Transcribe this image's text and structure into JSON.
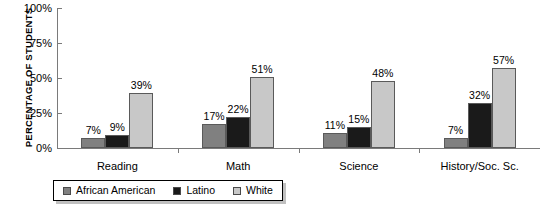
{
  "chart_data": {
    "type": "bar",
    "title": "",
    "xlabel": "",
    "ylabel": "PERCENTAGE OF STUDENTS",
    "ylim": [
      0,
      100
    ],
    "yticks": [
      "0%",
      "25%",
      "50%",
      "75%",
      "100%"
    ],
    "ytick_values": [
      0,
      25,
      50,
      75,
      100
    ],
    "grid": false,
    "legend_position": "bottom-left",
    "categories": [
      "Reading",
      "Math",
      "Science",
      "History/Soc. Sc."
    ],
    "series": [
      {
        "name": "African American",
        "color": "#808080",
        "values": [
          7,
          17,
          11,
          7
        ],
        "labels": [
          "7%",
          "17%",
          "11%",
          "7%"
        ]
      },
      {
        "name": "Latino",
        "color": "#1a1a1a",
        "values": [
          9,
          22,
          15,
          32
        ],
        "labels": [
          "9%",
          "22%",
          "15%",
          "32%"
        ]
      },
      {
        "name": "White",
        "color": "#c8c8c8",
        "values": [
          39,
          51,
          48,
          57
        ],
        "labels": [
          "39%",
          "51%",
          "48%",
          "57%"
        ]
      }
    ]
  },
  "legend": {
    "items": [
      {
        "label": "African American",
        "color": "#808080"
      },
      {
        "label": "Latino",
        "color": "#1a1a1a"
      },
      {
        "label": "White",
        "color": "#c8c8c8"
      }
    ]
  }
}
